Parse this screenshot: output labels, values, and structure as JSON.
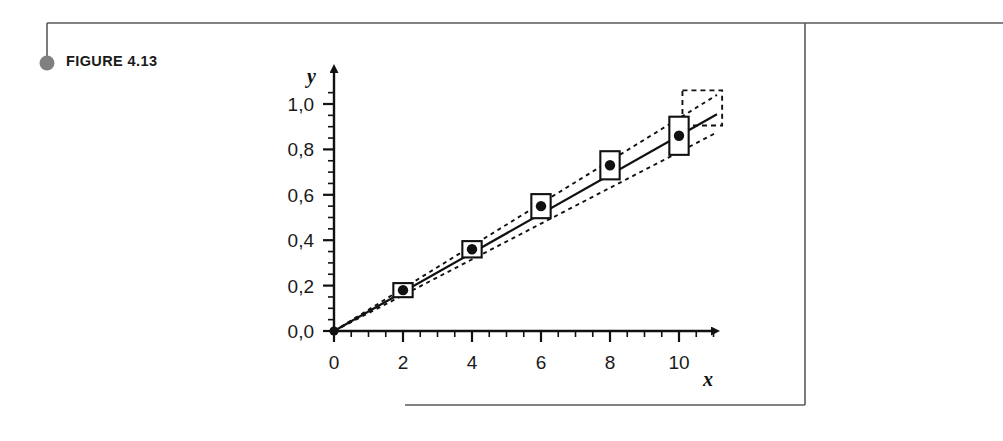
{
  "figure": {
    "caption": "FIGURE 4.13",
    "bullet_color": "#808080",
    "frame_color": "#5a5a5a"
  },
  "chart_data": {
    "type": "scatter",
    "title": "",
    "subtitle": "",
    "xlabel": "x",
    "ylabel": "y",
    "xlim": [
      0,
      11.6
    ],
    "ylim": [
      0,
      1.12
    ],
    "grid": false,
    "legend": false,
    "decimal_separator": ",",
    "x_ticks": [
      0,
      2,
      4,
      6,
      8,
      10
    ],
    "x_tick_labels": [
      "0",
      "2",
      "4",
      "6",
      "8",
      "10"
    ],
    "x_minor_step": 0.5,
    "y_ticks": [
      0.0,
      0.2,
      0.4,
      0.6,
      0.8,
      1.0
    ],
    "y_tick_labels": [
      "0,0",
      "0,2",
      "0,4",
      "0,6",
      "0,8",
      "1,0"
    ],
    "y_minor_step": 0.05,
    "x": [
      2,
      4,
      6,
      8,
      10
    ],
    "values": [
      0.18,
      0.36,
      0.55,
      0.73,
      0.86
    ],
    "point_marker": "filled-circle",
    "error_boxes": [
      {
        "x": 2,
        "y": 0.18,
        "x_half_width": 0.28,
        "y_half_height": 0.031
      },
      {
        "x": 4,
        "y": 0.36,
        "x_half_width": 0.28,
        "y_half_height": 0.036
      },
      {
        "x": 6,
        "y": 0.55,
        "x_half_width": 0.28,
        "y_half_height": 0.053
      },
      {
        "x": 8,
        "y": 0.73,
        "x_half_width": 0.28,
        "y_half_height": 0.062
      },
      {
        "x": 10,
        "y": 0.86,
        "x_half_width": 0.28,
        "y_half_height": 0.084
      }
    ],
    "series": [
      {
        "name": "regression-line",
        "style": "solid",
        "x": [
          0,
          11.1
        ],
        "values": [
          0.0,
          0.955
        ]
      },
      {
        "name": "upper-confidence-band",
        "style": "dashed",
        "x": [
          0,
          11.1
        ],
        "values": [
          0.0,
          1.04
        ]
      },
      {
        "name": "lower-confidence-band",
        "style": "dashed",
        "x": [
          0,
          11.1
        ],
        "values": [
          0.0,
          0.875
        ]
      }
    ],
    "prediction_region": {
      "style": "dashed-rectangle",
      "x_min": 10.1,
      "x_max": 11.25,
      "y_min": 0.905,
      "y_max": 1.06
    },
    "annotations": []
  }
}
